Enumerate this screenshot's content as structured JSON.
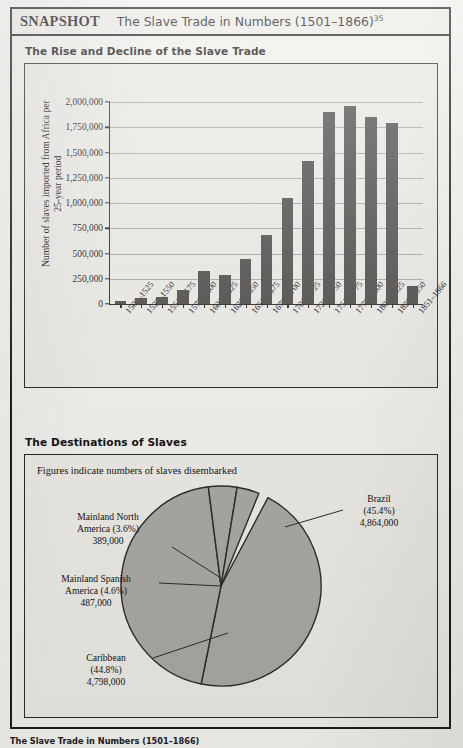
{
  "header": {
    "tag": "SNAPSHOT",
    "title": "The Slave Trade in Numbers (1501–1866)",
    "title_superscript": "35"
  },
  "sections": {
    "bar_heading": "The Rise and Decline of the Slave Trade",
    "pie_heading": "The Destinations of Slaves"
  },
  "pie_note": "Figures indicate numbers of slaves disembarked",
  "page_caption": "The Slave Trade in Numbers (1501–1866)",
  "chart_data": [
    {
      "type": "bar",
      "title": "The Rise and Decline of the Slave Trade",
      "xlabel": "",
      "ylabel": "Number of slaves imported from Africa per 25-year period",
      "ylim": [
        0,
        2000000
      ],
      "ytick_labels": [
        "0",
        "250,000",
        "500,000",
        "750,000",
        "1,000,000",
        "1,250,000",
        "1,500,000",
        "1,750,000",
        "2,000,000"
      ],
      "ytick_values": [
        0,
        250000,
        500000,
        750000,
        1000000,
        1250000,
        1500000,
        1750000,
        2000000
      ],
      "grid": true,
      "legend": "none",
      "categories": [
        "1501–1525",
        "1526–1550",
        "1551–1575",
        "1576–1600",
        "1601–1625",
        "1626–1650",
        "1651–1675",
        "1676–1700",
        "1701–1725",
        "1726–1750",
        "1751–1775",
        "1776–1800",
        "1801–1825",
        "1826–1850",
        "1851–1866"
      ],
      "values": [
        33000,
        60000,
        70000,
        140000,
        330000,
        290000,
        450000,
        680000,
        1050000,
        1420000,
        1900000,
        1960000,
        1850000,
        1790000,
        180000
      ]
    },
    {
      "type": "pie",
      "title": "The Destinations of Slaves",
      "note": "Figures indicate numbers of slaves disembarked",
      "legend": "callout-labels",
      "total": 10538000,
      "slices": [
        {
          "name": "Brazil",
          "percent_label": "(45.4%)",
          "percent": 45.4,
          "value_label": "4,864,000",
          "value": 4864000,
          "color": "#a8a7a2"
        },
        {
          "name": "Caribbean",
          "percent_label": "(44.8%)",
          "percent": 44.8,
          "value_label": "4,798,000",
          "value": 4798000,
          "color": "#a8a7a2"
        },
        {
          "name": "Mainland Spanish America",
          "name_line1": "Mainland Spanish",
          "name_line2": "America (4.6%)",
          "percent_label": "(4.6%)",
          "percent": 4.6,
          "value_label": "487,000",
          "value": 487000,
          "color": "#a8a7a2"
        },
        {
          "name": "Mainland North America",
          "name_line1": "Mainland North",
          "name_line2": "America (3.6%)",
          "percent_label": "(3.6%)",
          "percent": 3.6,
          "value_label": "389,000",
          "value": 389000,
          "color": "#a8a7a2"
        }
      ]
    }
  ],
  "colors": {
    "bar_fill": "#4e4d4c",
    "pie_fill": "#a8a7a2",
    "frame": "#1d1d1d",
    "panel_bg": "#e9e8e3",
    "page_bg": "#f2f1ed"
  }
}
